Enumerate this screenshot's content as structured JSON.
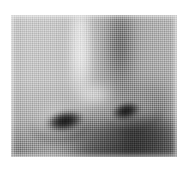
{
  "image": {
    "subject": "human nose close-up",
    "media": "grayscale halftone photograph",
    "alt_text": "Close-up grayscale photograph of a human nose showing both nostrils, the nose bridge highlight and surrounding skin",
    "canvas": {
      "width_px": 188,
      "height_px": 173,
      "background_color": "#ffffff"
    },
    "plate": {
      "left_px": 11,
      "top_px": 15,
      "width_px": 166,
      "height_px": 142,
      "base_color": "#b4b4b4"
    },
    "palette": {
      "paper_white": "#ffffff",
      "skin_light": "#c2c2c2",
      "skin_mid": "#b4b4b4",
      "skin_shadow": "#9b9b9b",
      "nostril_dark": "#1a1a1a",
      "highlight_white": "#f2f2f2"
    },
    "features": [
      {
        "name": "nose-bridge-highlight",
        "label": "Bridge highlight",
        "center_px": [
          70,
          52
        ],
        "tone": "highlight"
      },
      {
        "name": "nose-bridge-shadow",
        "label": "Bridge shadow band",
        "center_px": [
          109,
          46
        ],
        "tone": "shadow"
      },
      {
        "name": "nose-tip-highlight",
        "label": "Nose tip highlight",
        "center_px": [
          84,
          80
        ],
        "tone": "highlight"
      },
      {
        "name": "nostril-left",
        "label": "Left nostril",
        "center_px": [
          54,
          106
        ],
        "width_px": 44,
        "height_px": 24,
        "rotation_deg": -11,
        "tone": "dark"
      },
      {
        "name": "nostril-right",
        "label": "Right nostril",
        "center_px": [
          115,
          96
        ],
        "width_px": 34,
        "height_px": 20,
        "rotation_deg": -14,
        "tone": "dark"
      },
      {
        "name": "ala-left",
        "label": "Left nostril wing",
        "center_px": [
          49,
          102
        ],
        "tone": "midtone"
      },
      {
        "name": "ala-right",
        "label": "Right nostril wing",
        "center_px": [
          127,
          92
        ],
        "tone": "midtone"
      },
      {
        "name": "subnasal-shadow",
        "label": "Shadow beneath the nose",
        "center_px": [
          103,
          131
        ],
        "tone": "shadow"
      },
      {
        "name": "nasolabial-shadow",
        "label": "Nasolabial fold shadow",
        "center_px": [
          134,
          105
        ],
        "tone": "shadow"
      },
      {
        "name": "philtrum-light",
        "label": "Upper lip highlight",
        "center_px": [
          46,
          135
        ],
        "tone": "midtone"
      }
    ]
  }
}
